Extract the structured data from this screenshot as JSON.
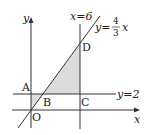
{
  "diagram": {
    "axes": {
      "x_label": "x",
      "y_label": "y",
      "origin_label": "O"
    },
    "lines": {
      "vertical": "x=6",
      "horizontal": "y=2",
      "slope_prefix": "y=",
      "slope_num": "4",
      "slope_den": "3",
      "slope_var": "x"
    },
    "points": {
      "A": "A",
      "B": "B",
      "C": "C",
      "D": "D"
    },
    "shaded_regions": [
      "triangle AOB",
      "triangle BCD"
    ],
    "colors": {
      "line": "#333333",
      "shade": "#dcdcdc"
    }
  }
}
